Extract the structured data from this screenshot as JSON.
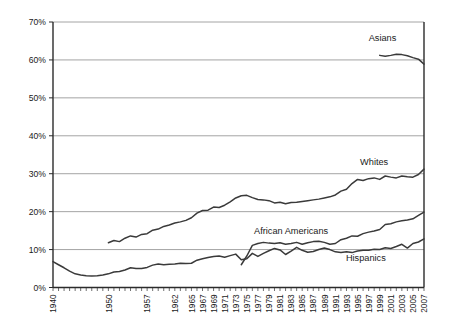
{
  "chart_data": {
    "type": "line",
    "title": "",
    "subtitle": "",
    "xlabel": "",
    "ylabel": "",
    "grid": "horizontal",
    "legend_position": "inline-labels",
    "xlim": [
      1940,
      2007
    ],
    "ylim": [
      0,
      70
    ],
    "ytick_labels": [
      "0%",
      "10%",
      "20%",
      "30%",
      "40%",
      "50%",
      "60%",
      "70%"
    ],
    "ytick_values": [
      0,
      10,
      20,
      30,
      40,
      50,
      60,
      70
    ],
    "xtick_labels": [
      "1940",
      "1950",
      "1957",
      "1962",
      "1965",
      "1967",
      "1969",
      "1971",
      "1973",
      "1975",
      "1977",
      "1979",
      "1981",
      "1983",
      "1985",
      "1987",
      "1989",
      "1991",
      "1993",
      "1995",
      "1997",
      "1999",
      "2001",
      "2003",
      "2005",
      "2007"
    ],
    "xtick_values": [
      1940,
      1950,
      1957,
      1962,
      1965,
      1967,
      1969,
      1971,
      1973,
      1975,
      1977,
      1979,
      1981,
      1983,
      1985,
      1987,
      1989,
      1991,
      1993,
      1995,
      1997,
      1999,
      2001,
      2003,
      2005,
      2007
    ],
    "series": [
      {
        "name": "Asians",
        "label": "Asians",
        "label_x": 1999.5,
        "label_y": 65.0,
        "color": "#3a3a3a",
        "x": [
          1999,
          2000,
          2001,
          2002,
          2003,
          2004,
          2005,
          2006,
          2007
        ],
        "values": [
          61.2,
          61.0,
          61.2,
          61.5,
          61.4,
          61.1,
          60.6,
          60.2,
          58.9
        ]
      },
      {
        "name": "Whites",
        "label": "Whites",
        "label_x": 1998.0,
        "label_y": 32.2,
        "color": "#3a3a3a",
        "x": [
          1950,
          1951,
          1952,
          1953,
          1954,
          1955,
          1956,
          1957,
          1958,
          1959,
          1960,
          1961,
          1962,
          1963,
          1964,
          1965,
          1966,
          1967,
          1968,
          1969,
          1970,
          1971,
          1972,
          1973,
          1974,
          1975,
          1976,
          1977,
          1978,
          1979,
          1980,
          1981,
          1982,
          1983,
          1984,
          1985,
          1986,
          1987,
          1988,
          1989,
          1990,
          1991,
          1992,
          1993,
          1994,
          1995,
          1996,
          1997,
          1998,
          1999,
          2000,
          2001,
          2002,
          2003,
          2004,
          2005,
          2006,
          2007
        ],
        "values": [
          11.8,
          12.4,
          12.1,
          13.0,
          13.6,
          13.3,
          14.0,
          14.2,
          15.1,
          15.4,
          16.1,
          16.5,
          17.0,
          17.3,
          17.7,
          18.4,
          19.6,
          20.3,
          20.4,
          21.2,
          21.1,
          21.7,
          22.6,
          23.6,
          24.2,
          24.3,
          23.7,
          23.2,
          23.1,
          22.9,
          22.3,
          22.5,
          22.1,
          22.4,
          22.5,
          22.7,
          22.9,
          23.1,
          23.3,
          23.6,
          23.9,
          24.4,
          25.4,
          25.9,
          27.4,
          28.5,
          28.2,
          28.7,
          28.9,
          28.5,
          29.4,
          29.1,
          28.9,
          29.4,
          29.2,
          29.1,
          29.8,
          31.2
        ]
      },
      {
        "name": "African Americans",
        "label": "African Americans",
        "label_x": 1983.0,
        "label_y": 14.0,
        "color": "#3a3a3a",
        "x": [
          1974,
          1975,
          1976,
          1977,
          1978,
          1979,
          1980,
          1981,
          1982,
          1983,
          1984,
          1985,
          1986,
          1987,
          1988,
          1989,
          1990,
          1991,
          1992,
          1993,
          1994,
          1995,
          1996,
          1997,
          1998,
          1999,
          2000,
          2001,
          2002,
          2003,
          2004,
          2005,
          2006,
          2007
        ],
        "values": [
          6.0,
          8.3,
          11.1,
          11.6,
          11.9,
          11.7,
          11.6,
          11.8,
          11.4,
          11.6,
          11.9,
          11.4,
          11.8,
          12.1,
          12.2,
          11.9,
          11.4,
          11.6,
          12.6,
          13.0,
          13.6,
          13.5,
          14.2,
          14.6,
          14.9,
          15.3,
          16.6,
          16.8,
          17.3,
          17.6,
          17.8,
          18.1,
          19.0,
          19.9
        ]
      },
      {
        "name": "Hispanics",
        "label": "Hispanics",
        "label_x": 1996.5,
        "label_y": 7.0,
        "color": "#3a3a3a",
        "x": [
          1940,
          1941,
          1942,
          1943,
          1944,
          1945,
          1946,
          1947,
          1948,
          1949,
          1950,
          1951,
          1952,
          1953,
          1954,
          1955,
          1956,
          1957,
          1958,
          1959,
          1960,
          1961,
          1962,
          1963,
          1964,
          1965,
          1966,
          1967,
          1968,
          1969,
          1970,
          1971,
          1972,
          1973,
          1974,
          1975,
          1976,
          1977,
          1978,
          1979,
          1980,
          1981,
          1982,
          1983,
          1984,
          1985,
          1986,
          1987,
          1988,
          1989,
          1990,
          1991,
          1992,
          1993,
          1994,
          1995,
          1996,
          1997,
          1998,
          1999,
          2000,
          2001,
          2002,
          2003,
          2004,
          2005,
          2006,
          2007
        ],
        "values": [
          6.8,
          6.0,
          5.2,
          4.3,
          3.6,
          3.3,
          3.1,
          3.0,
          3.1,
          3.3,
          3.6,
          4.1,
          4.2,
          4.6,
          5.2,
          5.0,
          5.0,
          5.3,
          5.9,
          6.2,
          6.0,
          6.1,
          6.2,
          6.4,
          6.3,
          6.4,
          7.2,
          7.6,
          7.9,
          8.2,
          8.3,
          8.0,
          8.4,
          8.8,
          7.3,
          7.6,
          9.0,
          8.2,
          9.0,
          9.7,
          10.3,
          9.9,
          8.7,
          9.6,
          10.6,
          9.8,
          9.3,
          9.5,
          10.0,
          10.4,
          10.0,
          9.4,
          9.2,
          9.4,
          9.2,
          9.6,
          9.8,
          9.8,
          10.1,
          10.0,
          10.5,
          10.3,
          10.8,
          11.4,
          10.4,
          11.6,
          12.0,
          12.8
        ]
      }
    ]
  }
}
